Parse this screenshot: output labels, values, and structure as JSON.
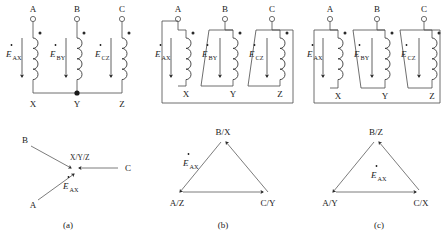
{
  "figure": {
    "subfigures": [
      {
        "caption": "(a)",
        "connection": "wye",
        "terminals": [
          "A",
          "B",
          "C"
        ],
        "winding_ends": [
          "X",
          "Y",
          "Z"
        ],
        "emf_labels": [
          "E",
          "E",
          "E"
        ],
        "emf_subscripts": [
          "AX",
          "BY",
          "CZ"
        ],
        "neutral_label": "X/Y/Z",
        "phasor_vertices": [
          "B",
          "C",
          "A"
        ],
        "phasor_center_label": "X/Y/Z",
        "phasor_emf_label": "E",
        "phasor_emf_sub": "AX"
      },
      {
        "caption": "(b)",
        "connection": "delta-forward",
        "terminals": [
          "A",
          "B",
          "C"
        ],
        "winding_ends": [
          "X",
          "Y",
          "Z"
        ],
        "emf_labels": [
          "E",
          "E",
          "E"
        ],
        "emf_subscripts": [
          "AX",
          "BY",
          "CZ"
        ],
        "phasor_vertices": [
          "B/X",
          "A/Z",
          "C/Y"
        ],
        "phasor_emf_label": "E",
        "phasor_emf_sub": "AX"
      },
      {
        "caption": "(c)",
        "connection": "delta-reverse",
        "terminals": [
          "A",
          "B",
          "C"
        ],
        "winding_ends": [
          "X",
          "Y",
          "Z"
        ],
        "emf_labels": [
          "E",
          "E",
          "E"
        ],
        "emf_subscripts": [
          "AX",
          "BY",
          "CZ"
        ],
        "phasor_vertices": [
          "B/Z",
          "A/Y",
          "C/X"
        ],
        "phasor_emf_label": "E",
        "phasor_emf_sub": "AX"
      }
    ],
    "icons": {
      "terminal": "open-circle-terminal",
      "polarity": "polarity-dot",
      "junction": "junction-dot",
      "coil": "winding-coil",
      "arrow": "direction-arrow"
    },
    "colors": {
      "line": "#4a4a4a",
      "text": "#1a1a1a",
      "background": "#ffffff"
    }
  }
}
